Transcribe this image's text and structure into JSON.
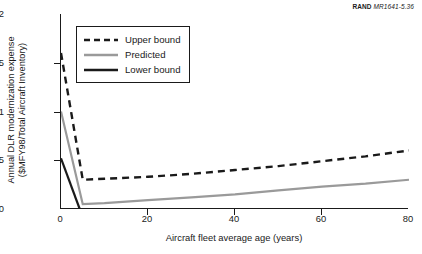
{
  "figure_tag": {
    "brand": "RAND",
    "code": "MR1641-5.36"
  },
  "axes": {
    "ylabel_line1": "Annual DLR modernization expense",
    "ylabel_line2": "($MFY98/Total Aircraft Inventory)",
    "xlabel": "Aircraft fleet average age (years)"
  },
  "legend": {
    "items": [
      {
        "label": "Upper bound",
        "style": "dashed",
        "color": "#1a1a1a"
      },
      {
        "label": "Predicted",
        "style": "solid",
        "color": "#9a9a9a"
      },
      {
        "label": "Lower bound",
        "style": "solid",
        "color": "#1a1a1a"
      }
    ]
  },
  "colors": {
    "axis": "#1a1a1a",
    "upper_bound": "#1a1a1a",
    "predicted": "#9a9a9a",
    "lower_bound": "#1a1a1a",
    "background": "#ffffff"
  },
  "chart_data": {
    "type": "line",
    "title": "",
    "xlabel": "Aircraft fleet average age (years)",
    "ylabel": "Annual DLR modernization expense ($MFY98/Total Aircraft Inventory)",
    "xlim": [
      0,
      80
    ],
    "ylim": [
      0,
      2
    ],
    "xticks": [
      0,
      20,
      40,
      60,
      80
    ],
    "yticks": [
      0,
      0.5,
      1,
      1.5,
      2
    ],
    "grid": false,
    "legend_position": "upper left inside",
    "series": [
      {
        "name": "Upper bound",
        "style": "dashed",
        "color": "#1a1a1a",
        "x": [
          0,
          5,
          10,
          20,
          30,
          40,
          50,
          60,
          70,
          80
        ],
        "y": [
          1.6,
          0.3,
          0.31,
          0.33,
          0.36,
          0.4,
          0.44,
          0.49,
          0.54,
          0.6
        ]
      },
      {
        "name": "Predicted",
        "style": "solid",
        "color": "#9a9a9a",
        "x": [
          0,
          5,
          10,
          20,
          30,
          40,
          50,
          60,
          70,
          80
        ],
        "y": [
          1.0,
          0.05,
          0.06,
          0.09,
          0.12,
          0.15,
          0.19,
          0.23,
          0.26,
          0.3
        ]
      },
      {
        "name": "Lower bound",
        "style": "solid",
        "color": "#1a1a1a",
        "x": [
          0,
          4.3
        ],
        "y": [
          0.52,
          0.0
        ]
      }
    ]
  }
}
